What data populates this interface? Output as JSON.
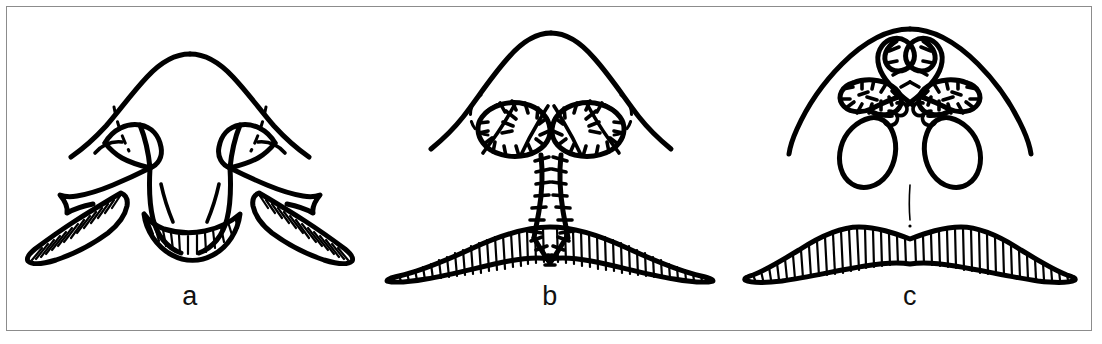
{
  "figure": {
    "domain_kind": "line-art medical illustration",
    "title_text": "",
    "background_color": "#ffffff",
    "ink_color": "#000000",
    "frame_color": "#8c8c8c",
    "panel_count": 3
  },
  "panels": [
    {
      "label": "a",
      "caption_text": "",
      "stage": "preoperative markings with elevated lateral lip flaps and central prolabium",
      "features": [
        "nose-outline",
        "dashed-alar-base-lines",
        "left-nostril-sill-flap",
        "right-nostril-sill-flap",
        "left-lateral-lip-flap-hatched",
        "right-lateral-lip-flap-hatched",
        "central-prolabium-with-hatched-vermilion"
      ],
      "hatching": "diagonal on lateral flaps, vertical on central vermilion"
    },
    {
      "label": "b",
      "caption_text": "",
      "stage": "closure with interrupted sutures along nostril rims and philtral columns",
      "features": [
        "nose-outline",
        "dashed-alar-base-lines",
        "left-nostril-suture-loop",
        "right-nostril-suture-loop",
        "left-philtral-suture-line",
        "right-philtral-suture-line",
        "v-shaped-vermilion-suture",
        "lip-body-hatched"
      ],
      "hatching": "vertical across the lip body"
    },
    {
      "label": "c",
      "caption_text": "",
      "stage": "final result with crossed columellar sutures and restored nostrils",
      "features": [
        "nose-outline",
        "crossed-columellar-sutures",
        "left-nostril-suture-cluster",
        "right-nostril-suture-cluster",
        "left-nostril-opening",
        "right-nostril-opening",
        "philtral-midline",
        "lip-body-hatched"
      ],
      "hatching": "vertical across the lip body"
    }
  ]
}
